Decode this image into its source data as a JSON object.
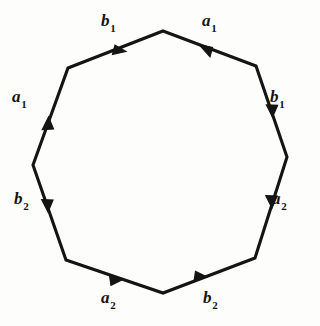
{
  "figure": {
    "type": "fundamental-polygon",
    "shape": "octagon",
    "stroke_color": "#141414",
    "background_color": "#fdfdfc",
    "label_color": "#141414"
  },
  "labels": {
    "b1_top": {
      "base": "b",
      "sub": "1"
    },
    "a1_top": {
      "base": "a",
      "sub": "1"
    },
    "a1_left": {
      "base": "a",
      "sub": "1"
    },
    "b1_right": {
      "base": "b",
      "sub": "1"
    },
    "b2_left": {
      "base": "b",
      "sub": "2"
    },
    "a2_right": {
      "base": "a",
      "sub": "2"
    },
    "a2_bottom": {
      "base": "a",
      "sub": "2"
    },
    "b2_bottom": {
      "base": "b",
      "sub": "2"
    }
  },
  "chart_data": {
    "type": "diagram",
    "title": "",
    "vertices": [
      {
        "id": "v-top",
        "x": 163,
        "y": 31
      },
      {
        "id": "v-upper-right",
        "x": 256,
        "y": 66
      },
      {
        "id": "v-right",
        "x": 287,
        "y": 157
      },
      {
        "id": "v-lower-right",
        "x": 255,
        "y": 258
      },
      {
        "id": "v-bottom",
        "x": 163,
        "y": 293
      },
      {
        "id": "v-lower-left",
        "x": 66,
        "y": 260
      },
      {
        "id": "v-left",
        "x": 33,
        "y": 165
      },
      {
        "id": "v-upper-left",
        "x": 68,
        "y": 68
      }
    ],
    "edges": [
      {
        "id": "edge-b1-top",
        "label": "b₁",
        "from": "v-upper-left",
        "to": "v-top",
        "arrow_direction": "toward-top-vertex",
        "arrow_t": 0.62
      },
      {
        "id": "edge-a1-top",
        "label": "a₁",
        "from": "v-upper-right",
        "to": "v-top",
        "arrow_direction": "toward-top-vertex",
        "arrow_t": 0.62
      },
      {
        "id": "edge-a1-left",
        "label": "a₁",
        "from": "v-left",
        "to": "v-upper-left",
        "arrow_direction": "upward",
        "arrow_t": 0.55
      },
      {
        "id": "edge-b1-right",
        "label": "b₁",
        "from": "v-upper-right",
        "to": "v-right",
        "arrow_direction": "downward",
        "arrow_t": 0.45
      },
      {
        "id": "edge-b2-left",
        "label": "b₂",
        "from": "v-left",
        "to": "v-lower-left",
        "arrow_direction": "downward",
        "arrow_t": 0.42
      },
      {
        "id": "edge-a2-right",
        "label": "a₂",
        "from": "v-right",
        "to": "v-lower-right",
        "arrow_direction": "downward",
        "arrow_t": 0.45
      },
      {
        "id": "edge-a2-bottom",
        "label": "a₂",
        "from": "v-lower-left",
        "to": "v-bottom",
        "arrow_direction": "toward-bottom-right",
        "arrow_t": 0.45
      },
      {
        "id": "edge-b2-bottom",
        "label": "b₂",
        "from": "v-bottom",
        "to": "v-lower-right",
        "arrow_direction": "toward-upper-right",
        "arrow_t": 0.45
      }
    ],
    "edge_word": "b1 a1 a1 b1 b2 a2 a2 b2",
    "grid": false,
    "legend": "none"
  }
}
